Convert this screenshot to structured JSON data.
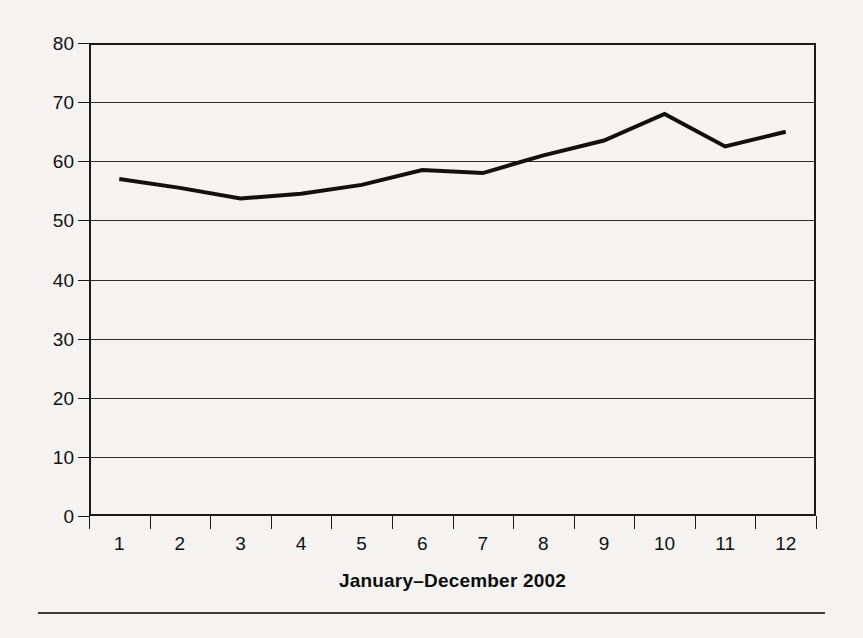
{
  "chart_data": {
    "type": "line",
    "title": "",
    "xlabel": "January–December 2002",
    "ylabel": "",
    "categories": [
      "1",
      "2",
      "3",
      "4",
      "5",
      "6",
      "7",
      "8",
      "9",
      "10",
      "11",
      "12"
    ],
    "x": [
      1,
      2,
      3,
      4,
      5,
      6,
      7,
      8,
      9,
      10,
      11,
      12
    ],
    "values": [
      57,
      55.5,
      53.7,
      54.5,
      56,
      58.5,
      58,
      61,
      63.5,
      68,
      62.5,
      65
    ],
    "series": [
      {
        "name": "value",
        "values": [
          57,
          55.5,
          53.7,
          54.5,
          56,
          58.5,
          58,
          61,
          63.5,
          68,
          62.5,
          65
        ]
      }
    ],
    "ylim": [
      0,
      80
    ],
    "ytick_values": [
      0,
      10,
      20,
      30,
      40,
      50,
      60,
      70,
      80
    ],
    "ytick_labels": [
      "0",
      "10",
      "20",
      "30",
      "40",
      "50",
      "60",
      "70",
      "80"
    ],
    "grid": true,
    "grid_axis": "y",
    "legend": false,
    "legend_position": "none",
    "line_color": "#101010",
    "line_width_px": 4,
    "markers": false,
    "background_color": "#f4f3f1",
    "axis_color": "#1a1a1a"
  },
  "figure": {
    "footer_rule": true
  }
}
